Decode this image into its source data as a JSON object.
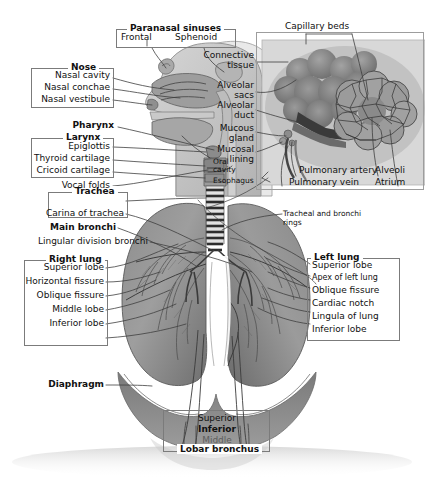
{
  "figure": {
    "background_color": "#ffffff",
    "line_color": "#4a4a4a",
    "box_border_color": "#7b7b7b"
  },
  "groups": {
    "paranasal_sinuses": {
      "title": "Paranasal sinuses",
      "items": [
        "Frontal",
        "Sphenoid"
      ]
    },
    "nose": {
      "title": "Nose",
      "items": [
        "Nasal cavity",
        "Nasal conchae",
        "Nasal vestibule"
      ]
    },
    "pharynx": {
      "title": "Pharynx"
    },
    "larynx": {
      "title": "Larynx",
      "items": [
        "Epiglottis",
        "Thyroid cartilage",
        "Cricoid cartilage"
      ]
    },
    "vocal_folds": {
      "title": "Vocal folds"
    },
    "trachea": {
      "title": "Trachea",
      "items": [
        "Carina of trachea"
      ]
    },
    "main_bronchi": {
      "title": "Main bronchi"
    },
    "lingular_division_bronchi": {
      "title": "Lingular division bronchi"
    },
    "right_lung": {
      "title": "Right lung",
      "items": [
        "Superior lobe",
        "Horizontal fissure",
        "Oblique fissure",
        "Middle lobe",
        "Inferior lobe"
      ]
    },
    "left_lung": {
      "title": "Left lung",
      "items": [
        "Superior lobe",
        "Apex of left lung",
        "Oblique fissure",
        "Cardiac notch",
        "Lingula of lung",
        "Inferior lobe"
      ]
    },
    "diaphragm": {
      "title": "Diaphragm"
    },
    "lobar_bronchus": {
      "title": "Lobar bronchus",
      "items": [
        "Superior",
        "Inferior",
        "Middle"
      ]
    }
  },
  "inset": {
    "capillary_beds": "Capillary beds",
    "connective_tissue_line1": "Connective",
    "connective_tissue_line2": "tissue",
    "alveolar_sacs_line1": "Alveolar",
    "alveolar_sacs_line2": "sacs",
    "alveolar_duct_line1": "Alveolar",
    "alveolar_duct_line2": "duct",
    "mucous_gland_line1": "Mucous",
    "mucous_gland_line2": "gland",
    "mucosal_lining_line1": "Mucosal",
    "mucosal_lining_line2": "lining",
    "pulmonary_artery": "Pulmonary artery",
    "pulmonary_vein": "Pulmonary vein",
    "alveoli": "Alveoli",
    "atrium": "Atrium"
  },
  "misc": {
    "oral_cavity_line1": "Oral",
    "oral_cavity_line2": "cavity",
    "esophagus": "Esophagus",
    "tracheal_rings_line1": "Tracheal and bronchi",
    "tracheal_rings_line2": "rings"
  }
}
